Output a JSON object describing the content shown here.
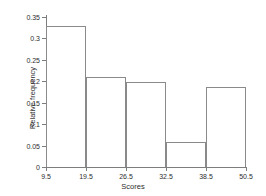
{
  "chart_data": {
    "type": "bar",
    "title": "",
    "subtitle": "",
    "xlabel": "Scores",
    "ylabel": "Relative frequency",
    "categories": [
      "9.5-19.5",
      "19.5-26.5",
      "26.5-32.5",
      "32.5-38.5",
      "38.5-50.5"
    ],
    "bin_edges": [
      9.5,
      19.5,
      26.5,
      32.5,
      38.5,
      50.5
    ],
    "values": [
      0.33,
      0.209,
      0.199,
      0.058,
      0.186
    ],
    "x_tick_labels": [
      "9.5",
      "19.5",
      "26.5",
      "32.5",
      "38.5",
      "50.5"
    ],
    "y_tick_labels": [
      "0",
      "0.05",
      "0.1",
      "0.15",
      "0.2",
      "0.25",
      "0.3",
      "0.35"
    ],
    "y_tick_values": [
      0,
      0.05,
      0.1,
      0.15,
      0.2,
      0.25,
      0.3,
      0.35
    ],
    "ylim": [
      0,
      0.35
    ],
    "grid": false,
    "legend": false,
    "legend_position": "none",
    "bar_fill": "none",
    "bar_edge_color": "#8a8a8a",
    "axis_color": "#7d7d7d",
    "background_color": "#ffffff",
    "spacing": "equal-width-bins",
    "annotations": []
  }
}
